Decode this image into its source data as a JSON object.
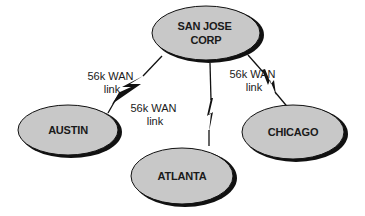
{
  "diagram": {
    "type": "network-topology",
    "colors": {
      "node_fill": "#c8c8c8",
      "node_stroke": "#111111",
      "shadow": "#111111",
      "link": "#111111"
    },
    "nodes": [
      {
        "id": "sanjose",
        "line1": "SAN JOSE",
        "line2": "CORP"
      },
      {
        "id": "austin",
        "label": "AUSTIN"
      },
      {
        "id": "atlanta",
        "label": "ATLANTA"
      },
      {
        "id": "chicago",
        "label": "CHICAGO"
      }
    ],
    "links": [
      {
        "from": "sanjose",
        "to": "austin",
        "line1": "56k WAN",
        "line2": "link"
      },
      {
        "from": "sanjose",
        "to": "atlanta",
        "line1": "56k WAN",
        "line2": "link"
      },
      {
        "from": "sanjose",
        "to": "chicago",
        "line1": "56k WAN",
        "line2": "link"
      }
    ]
  }
}
